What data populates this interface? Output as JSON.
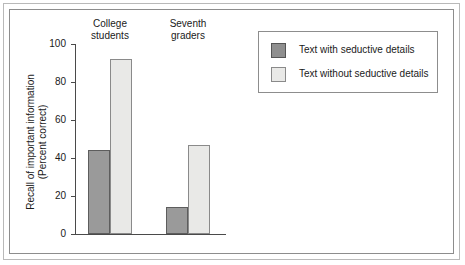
{
  "chart_data": {
    "type": "bar",
    "title": "",
    "xlabel": "",
    "ylabel": "Recall of important information (Percent correct)",
    "ylabel_line1": "Recall of important information",
    "ylabel_line2": "(Percent correct)",
    "ylim": [
      0,
      100
    ],
    "yticks": [
      0,
      20,
      40,
      60,
      80,
      100
    ],
    "ytick_labels": [
      "0",
      "20",
      "40",
      "60",
      "80",
      "100"
    ],
    "grid": false,
    "legend_position": "top-right",
    "categories": [
      "College students",
      "Seventh graders"
    ],
    "category_labels": [
      {
        "line1": "College",
        "line2": "students"
      },
      {
        "line1": "Seventh",
        "line2": "graders"
      }
    ],
    "series": [
      {
        "name": "Text with seductive details",
        "color": "#9a9a9a",
        "values": [
          44,
          14
        ]
      },
      {
        "name": "Text without seductive details",
        "color": "#e9e9e7",
        "values": [
          92,
          47
        ]
      }
    ]
  },
  "legend": {
    "items": [
      {
        "label": "Text with seductive details",
        "swatch": "dark"
      },
      {
        "label": "Text without seductive details",
        "swatch": "light"
      }
    ]
  },
  "colors": {
    "bar_dark": "#9a9a9a",
    "bar_light": "#e9e9e7",
    "axis": "#4a4a4a",
    "frame_outer": "#b9b9b9",
    "frame_inner": "#8d8d8d",
    "text": "#1a1a1a"
  }
}
